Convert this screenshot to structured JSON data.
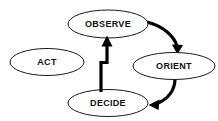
{
  "diagram": {
    "type": "cycle-flow-diagram",
    "background_color": "#ffffff",
    "node_fill_color": "#ffffff",
    "node_stroke_color": "#1a1a1a",
    "arrow_color": "#000000",
    "label_color": "#111111",
    "nodes": [
      {
        "id": "observe",
        "label": "OBSERVE",
        "cx": 108,
        "cy": 24,
        "rx": 40,
        "ry": 14
      },
      {
        "id": "act",
        "label": "ACT",
        "cx": 47,
        "cy": 62,
        "rx": 37,
        "ry": 13.5
      },
      {
        "id": "orient",
        "label": "ORIENT",
        "cx": 174,
        "cy": 66,
        "rx": 41,
        "ry": 13.5
      },
      {
        "id": "decide",
        "label": "DECIDE",
        "cx": 108,
        "cy": 103,
        "rx": 40,
        "ry": 13.5
      }
    ],
    "edges": [
      {
        "id": "observe-to-orient",
        "from": "OBSERVE",
        "to": "ORIENT",
        "style": "curved"
      },
      {
        "id": "orient-to-decide",
        "from": "ORIENT",
        "to": "DECIDE",
        "style": "curved"
      },
      {
        "id": "decide-to-observe",
        "from": "DECIDE",
        "to": "OBSERVE",
        "style": "elbow"
      }
    ]
  }
}
